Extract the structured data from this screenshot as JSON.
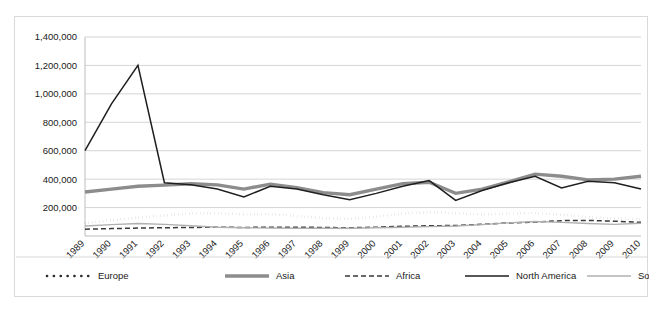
{
  "chart_data": {
    "type": "line",
    "title": "",
    "xlabel": "",
    "ylabel": "",
    "grid": true,
    "legend_position": "bottom",
    "ylim": [
      0,
      1400000
    ],
    "ytick_step": 200000,
    "ytick_labels": [
      "200,000",
      "400,000",
      "600,000",
      "800,000",
      "1,000,000",
      "1,200,000",
      "1,400,000"
    ],
    "ytick_values": [
      200000,
      400000,
      600000,
      800000,
      1000000,
      1200000,
      1400000
    ],
    "categories": [
      "1989",
      "1990",
      "1991",
      "1992",
      "1993",
      "1994",
      "1995",
      "1996",
      "1997",
      "1998",
      "1999",
      "2000",
      "2001",
      "2002",
      "2003",
      "2004",
      "2005",
      "2006",
      "2007",
      "2008",
      "2009",
      "2010"
    ],
    "series": [
      {
        "name": "Europe",
        "style": "dotted",
        "color": "#2b2b2b",
        "width": 2.6,
        "values": [
          90000,
          110000,
          130000,
          145000,
          158000,
          160000,
          152000,
          155000,
          140000,
          125000,
          120000,
          135000,
          158000,
          168000,
          160000,
          152000,
          158000,
          162000,
          150000,
          132000,
          122000,
          118000
        ]
      },
      {
        "name": "Asia",
        "style": "solid-thick",
        "color": "#8c8c8c",
        "width": 3.4,
        "values": [
          310000,
          330000,
          350000,
          358000,
          368000,
          360000,
          330000,
          365000,
          340000,
          305000,
          290000,
          330000,
          368000,
          378000,
          300000,
          330000,
          380000,
          435000,
          420000,
          395000,
          400000,
          420000
        ]
      },
      {
        "name": "Africa",
        "style": "dashed",
        "color": "#3a3a3a",
        "width": 1.5,
        "values": [
          48000,
          52000,
          56000,
          58000,
          60000,
          62000,
          60000,
          62000,
          62000,
          60000,
          58000,
          62000,
          68000,
          72000,
          74000,
          82000,
          92000,
          98000,
          108000,
          110000,
          104000,
          96000
        ]
      },
      {
        "name": "North America",
        "style": "solid-thin-dark",
        "color": "#1f1f1f",
        "width": 1.5,
        "values": [
          600000,
          930000,
          1200000,
          375000,
          360000,
          330000,
          275000,
          350000,
          330000,
          290000,
          255000,
          300000,
          350000,
          390000,
          250000,
          320000,
          375000,
          420000,
          338000,
          385000,
          375000,
          330000
        ]
      },
      {
        "name": "South America",
        "style": "solid-thin-light",
        "color": "#b0b0b0",
        "width": 1.4,
        "values": [
          70000,
          80000,
          88000,
          82000,
          72000,
          62000,
          58000,
          56000,
          55000,
          54000,
          54000,
          58000,
          62000,
          66000,
          70000,
          80000,
          92000,
          102000,
          96000,
          88000,
          82000,
          90000
        ]
      }
    ]
  },
  "legend": {
    "items": [
      {
        "label": "Europe"
      },
      {
        "label": "Asia"
      },
      {
        "label": "Africa"
      },
      {
        "label": "North America"
      },
      {
        "label": "South America"
      }
    ]
  }
}
